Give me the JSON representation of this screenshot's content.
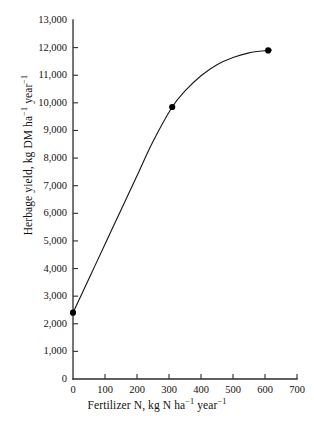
{
  "chart_data": {
    "type": "line",
    "title": "",
    "xlabel": "Fertilizer N, kg N ha⁻¹  year⁻¹",
    "ylabel": "Herbage yield, kg DM ha⁻¹  year⁻¹",
    "xlim": [
      0,
      700
    ],
    "ylim": [
      0,
      13000
    ],
    "grid": false,
    "legend": null,
    "x_tick_values": [
      0,
      100,
      200,
      300,
      400,
      500,
      600,
      700
    ],
    "x_tick_labels": [
      "0",
      "100",
      "200",
      "300",
      "400",
      "500",
      "600",
      "700"
    ],
    "y_tick_values": [
      0,
      1000,
      2000,
      3000,
      4000,
      5000,
      6000,
      7000,
      8000,
      9000,
      10000,
      11000,
      12000,
      13000
    ],
    "y_tick_labels": [
      "0",
      "1,000",
      "2,000",
      "3,000",
      "4,000",
      "5,000",
      "6,000",
      "7,000",
      "8,000",
      "9,000",
      "10,000",
      "11,000",
      "12,000",
      "13,000"
    ],
    "series": [
      {
        "name": "Herbage yield response to fertilizer N",
        "marker": "filled-circle",
        "line_color": "#1a1a1a",
        "marker_color": "#000000",
        "x": [
          0,
          310,
          610
        ],
        "values": [
          2400,
          9850,
          11900
        ],
        "curve_x": [
          0,
          50,
          100,
          150,
          200,
          250,
          310,
          350,
          400,
          450,
          500,
          550,
          610,
          620
        ],
        "curve_y": [
          2400,
          3640,
          4880,
          6120,
          7360,
          8600,
          9850,
          10430,
          10980,
          11380,
          11640,
          11810,
          11900,
          11910
        ]
      }
    ]
  },
  "axis": {
    "y_title": "Herbage yield, kg DM ha⁻¹  year⁻¹",
    "x_title": "Fertilizer N, kg N ha⁻¹  year⁻¹",
    "y_title_parts": {
      "prefix": "Herbage yield, kg DM ha",
      "sup1": "−1",
      "mid": "  year",
      "sup2": "−1"
    },
    "x_title_parts": {
      "prefix": "Fertilizer N, kg N ha",
      "sup1": "−1",
      "mid": "  year",
      "sup2": "−1"
    }
  },
  "colors": {
    "background": "#ffffff",
    "axis": "#2b2b2b",
    "curve": "#1a1a1a",
    "marker": "#000000",
    "text": "#111111"
  }
}
